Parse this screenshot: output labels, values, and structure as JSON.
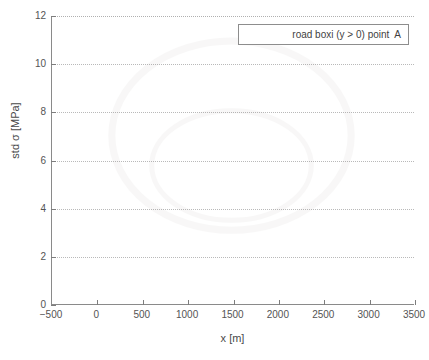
{
  "chart_data": {
    "type": "line",
    "title": "",
    "xlabel": "x [m]",
    "ylabel": "std σ [MPa]",
    "xlim": [
      -500,
      3500
    ],
    "ylim": [
      0,
      12
    ],
    "xticks": [
      -500,
      0,
      500,
      1000,
      1500,
      2000,
      2500,
      3000,
      3500
    ],
    "xtick_labels": [
      "−500",
      "0",
      "500",
      "1000",
      "1500",
      "2000",
      "2500",
      "3000",
      "3500"
    ],
    "yticks": [
      0,
      2,
      4,
      6,
      8,
      10,
      12
    ],
    "ytick_labels": [
      "0",
      "2",
      "4",
      "6",
      "8",
      "10",
      "12"
    ],
    "grid": "horizontal-dotted",
    "legend_position": "top-right",
    "legend": [
      {
        "label": "road boxi (y > 0) point  A"
      }
    ],
    "series": [
      {
        "name": "road boxi (y > 0) point  A",
        "x": [],
        "values": [],
        "note": "no visible data plotted in axes"
      }
    ],
    "colors": {
      "background": "#ffffff",
      "axis": "#8a8a8a",
      "gridline": "#b9b9b9",
      "text": "#4a4a4a",
      "legend_border": "#8d8d8d"
    }
  }
}
